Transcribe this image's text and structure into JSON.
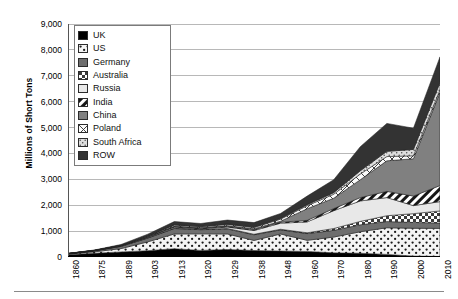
{
  "chart": {
    "type": "area",
    "ylabel": "Millions of Short Tons",
    "ylim": [
      0,
      9000
    ],
    "ystep": 1000,
    "ytick_labels": [
      "0",
      "1,000",
      "2,000",
      "3,000",
      "4,000",
      "5,000",
      "6,000",
      "7,000",
      "8,000",
      "9,000"
    ],
    "grid": true,
    "legend_position": "top-left-inside"
  },
  "legend": {
    "items": [
      {
        "label": "UK",
        "pattern": "solid-black",
        "color": "#000000"
      },
      {
        "label": "US",
        "pattern": "sparse-dots",
        "color": "#f2f2f2"
      },
      {
        "label": "Germany",
        "pattern": "solid-midgray",
        "color": "#6e6e6e"
      },
      {
        "label": "Australia",
        "pattern": "checker",
        "color": "#cfcfcf"
      },
      {
        "label": "Russia",
        "pattern": "solid-lightgray",
        "color": "#e8e8e8"
      },
      {
        "label": "India",
        "pattern": "diagonal-stripe",
        "color": "#ffffff"
      },
      {
        "label": "China",
        "pattern": "solid-gray",
        "color": "#808080"
      },
      {
        "label": "Poland",
        "pattern": "cross-diagonal",
        "color": "#fafafa"
      },
      {
        "label": "South Africa",
        "pattern": "fine-dots",
        "color": "#d9d9d9"
      },
      {
        "label": "ROW",
        "pattern": "solid-darkgray",
        "color": "#333333"
      }
    ]
  },
  "chart_data": {
    "type": "area",
    "stacked": true,
    "title": "",
    "xlabel": "",
    "ylabel": "Millions of Short Tons",
    "ylim": [
      0,
      9000
    ],
    "grid": true,
    "legend_position": "top-left-inside",
    "categories": [
      "1860",
      "1875",
      "1889",
      "1903",
      "1913",
      "1920",
      "1929",
      "1938",
      "1948",
      "1960",
      "1970",
      "1980",
      "1990",
      "2000",
      "2010"
    ],
    "series": [
      {
        "name": "UK",
        "values": [
          90,
          145,
          195,
          245,
          320,
          255,
          290,
          250,
          230,
          215,
          160,
          145,
          100,
          35,
          20
        ]
      },
      {
        "name": "US",
        "values": [
          20,
          55,
          130,
          340,
          570,
          640,
          600,
          390,
          660,
          430,
          610,
          830,
          1030,
          1075,
          1085
        ]
      },
      {
        "name": "Germany",
        "values": [
          16,
          40,
          85,
          145,
          210,
          160,
          195,
          220,
          160,
          260,
          260,
          270,
          240,
          225,
          210
        ]
      },
      {
        "name": "Australia",
        "values": [
          2,
          5,
          10,
          14,
          16,
          15,
          16,
          18,
          22,
          30,
          70,
          130,
          225,
          340,
          465
        ]
      },
      {
        "name": "Russia",
        "values": [
          1,
          2,
          7,
          20,
          40,
          20,
          55,
          145,
          235,
          420,
          690,
          790,
          700,
          310,
          360
        ]
      },
      {
        "name": "India",
        "values": [
          1,
          2,
          5,
          10,
          18,
          22,
          27,
          32,
          36,
          60,
          80,
          130,
          240,
          370,
          620
        ]
      },
      {
        "name": "China",
        "values": [
          2,
          4,
          8,
          14,
          20,
          25,
          30,
          40,
          40,
          450,
          400,
          690,
          1180,
          1440,
          3600
        ]
      },
      {
        "name": "Poland",
        "values": [
          1,
          3,
          8,
          18,
          45,
          35,
          50,
          45,
          80,
          115,
          155,
          220,
          165,
          115,
          100
        ]
      },
      {
        "name": "South Africa",
        "values": [
          0,
          1,
          2,
          5,
          9,
          12,
          14,
          18,
          28,
          42,
          60,
          125,
          200,
          245,
          280
        ]
      },
      {
        "name": "ROW",
        "values": [
          6,
          14,
          35,
          70,
          120,
          110,
          150,
          170,
          190,
          330,
          500,
          930,
          1080,
          820,
          990
        ]
      }
    ],
    "totals": [
      139,
      271,
      485,
      881,
      1368,
      1294,
      1427,
      1328,
      1681,
      2352,
      2985,
      4260,
      5160,
      4975,
      7730
    ]
  }
}
